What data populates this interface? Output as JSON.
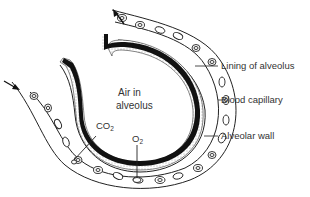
{
  "diagram": {
    "center_label_line1": "Air in",
    "center_label_line2": "alveolus",
    "labels": {
      "lining": "Lining of alveolus",
      "capillary": "Blood capillary",
      "wall": "Alveolar wall"
    },
    "gases": {
      "co2_main": "CO",
      "co2_sub": "2",
      "o2_main": "O",
      "o2_sub": "2"
    },
    "arrows": [
      {
        "name": "blood-flow-in-arrow",
        "direction": "inward"
      },
      {
        "name": "blood-flow-out-arrow",
        "direction": "outward"
      }
    ],
    "colors": {
      "ink": "#222222",
      "text": "#333333",
      "background": "#ffffff"
    }
  }
}
